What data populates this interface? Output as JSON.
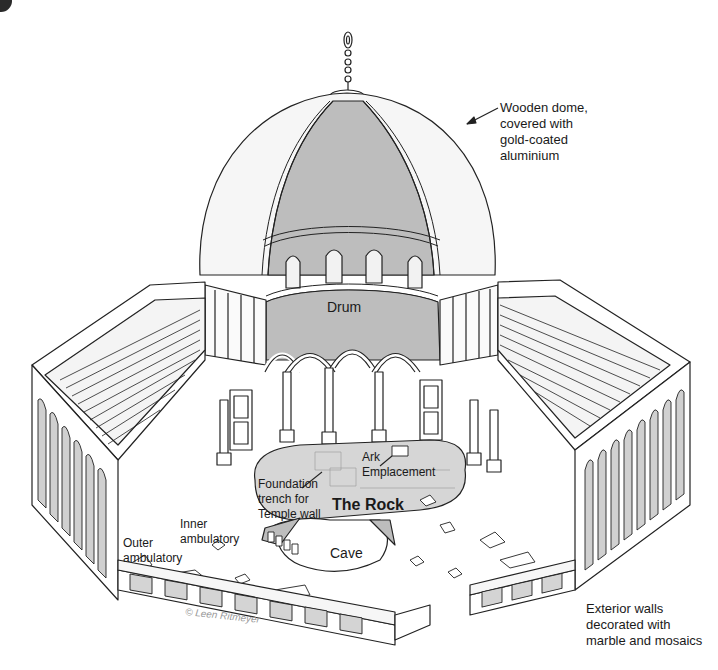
{
  "diagram": {
    "colors": {
      "line": "#222222",
      "shaded": "#bdbdbd",
      "light_fill": "#f2f2f2",
      "rock_fill": "#d6d6d6",
      "background": "#ffffff"
    },
    "labels": {
      "dome": "Wooden dome,\ncovered with\ngold-coated\naluminium",
      "drum": "Drum",
      "ark": "Ark\nEmplacement",
      "foundation": "Foundation\ntrench for\nTemple wall",
      "rock": "The Rock",
      "inner_ambulatory": "Inner\nambulatory",
      "outer_ambulatory": "Outer\nambulatory",
      "cave": "Cave",
      "exterior_walls": "Exterior walls\ndecorated with\nmarble and mosaics",
      "copyright": "© Leen Ritmeyer"
    }
  }
}
